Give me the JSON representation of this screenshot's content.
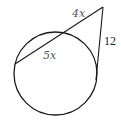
{
  "diagram": {
    "type": "circle-secant-tangent",
    "colors": {
      "stroke": "#1a1a1a",
      "label": "#555555",
      "number": "#222222",
      "background": "#ffffff"
    },
    "circle": {
      "cx": 55.5,
      "cy": 73.5,
      "r": 41.5
    },
    "external_point": {
      "x": 103,
      "y": 7
    },
    "secant": {
      "far_point": {
        "x": 15,
        "y": 64
      },
      "near_point": {
        "x": 63,
        "y": 32
      }
    },
    "tangent_point": {
      "x": 96,
      "y": 80
    },
    "labels": {
      "external_segment": "4x",
      "chord_segment": "5x",
      "tangent_segment": "12"
    }
  }
}
